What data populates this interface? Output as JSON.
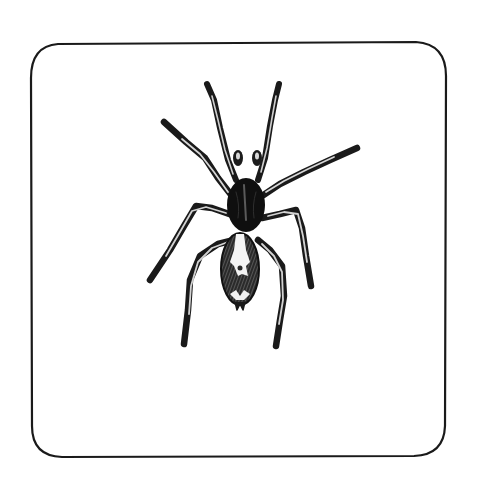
{
  "illustration": {
    "subject": "spider",
    "style": "pen-and-ink engraving",
    "frame": {
      "shape": "hand-drawn rounded rectangle",
      "stroke_color": "#1a1a1a",
      "background": "#ffffff"
    },
    "colors": {
      "ink": "#111111",
      "mid": "#4a4a4a",
      "light": "#d8d8d8",
      "paper": "#ffffff"
    }
  }
}
